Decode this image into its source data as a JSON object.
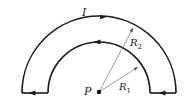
{
  "diagram": {
    "labels": {
      "current": "I",
      "point": "P",
      "r2_main": "R",
      "r2_sub": "2",
      "r1_main": "R",
      "r1_sub": "1"
    },
    "colors": {
      "wire": "#1a1a1a",
      "radius_line": "#8a8a8a",
      "background": "#ffffff"
    },
    "geometry": {
      "center": [
        99,
        92
      ],
      "outer_radius": 77,
      "inner_radius": 51
    }
  }
}
